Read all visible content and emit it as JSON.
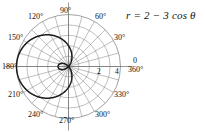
{
  "figure": {
    "equation_text": "r = 2 − 3 cos θ",
    "equation_parts": {
      "lhs": "r",
      "equals": "=",
      "a": "2",
      "minus": "−",
      "b": "3",
      "trig": "cos",
      "theta": "θ"
    }
  },
  "axis_labels": {
    "a90": "90°",
    "a120": "120°",
    "a60": "60°",
    "a150": "150°",
    "a30": "30°",
    "a180": "180°",
    "a0": "0",
    "a360": "360°",
    "a210": "210°",
    "a330": "330°",
    "a240": "240°",
    "a300": "300°",
    "a270": "270°"
  },
  "radial_labels": {
    "r2": "2",
    "r4": "4"
  },
  "colors": {
    "curve": "#1a1a1a",
    "grid": "#8a8a8a",
    "axis": "#6b6b6b",
    "text": "#111111",
    "background": "#ffffff"
  },
  "chart_data": {
    "type": "line",
    "coordinate_system": "polar",
    "title": "r = 2 − 3 cos θ",
    "curve_name": "limacon-with-inner-loop",
    "equation": "r = 2 - 3*cos(theta)",
    "parameters": {
      "a": 2,
      "b": 3
    },
    "theta_units": "degrees",
    "theta_range": [
      0,
      360
    ],
    "r_max_outer": 5,
    "r_min_signed": -1,
    "inner_loop_theta_range": [
      0,
      48.19
    ],
    "inner_loop_theta_range_2": [
      311.81,
      360
    ],
    "grid": true,
    "grid_radii": [
      1,
      2,
      3,
      4,
      5
    ],
    "labeled_radii": [
      2,
      4
    ],
    "grid_angles_deg": [
      0,
      15,
      30,
      45,
      60,
      75,
      90,
      105,
      120,
      135,
      150,
      165,
      180,
      195,
      210,
      225,
      240,
      255,
      270,
      285,
      300,
      315,
      330,
      345
    ],
    "labeled_angles_deg": [
      0,
      30,
      60,
      90,
      120,
      150,
      180,
      210,
      240,
      270,
      300,
      330,
      360
    ],
    "legend": "none",
    "xlabel": "",
    "ylabel": "",
    "samples": [
      {
        "theta": 0,
        "r": -1
      },
      {
        "theta": 10,
        "r": -0.954
      },
      {
        "theta": 20,
        "r": -0.819
      },
      {
        "theta": 30,
        "r": -0.598
      },
      {
        "theta": 40,
        "r": -0.298
      },
      {
        "theta": 48.19,
        "r": 0
      },
      {
        "theta": 60,
        "r": 0.5
      },
      {
        "theta": 75,
        "r": 1.224
      },
      {
        "theta": 90,
        "r": 2
      },
      {
        "theta": 105,
        "r": 2.776
      },
      {
        "theta": 120,
        "r": 3.5
      },
      {
        "theta": 135,
        "r": 4.121
      },
      {
        "theta": 150,
        "r": 4.598
      },
      {
        "theta": 165,
        "r": 4.898
      },
      {
        "theta": 180,
        "r": 5
      },
      {
        "theta": 195,
        "r": 4.898
      },
      {
        "theta": 210,
        "r": 4.598
      },
      {
        "theta": 225,
        "r": 4.121
      },
      {
        "theta": 240,
        "r": 3.5
      },
      {
        "theta": 255,
        "r": 2.776
      },
      {
        "theta": 270,
        "r": 2
      },
      {
        "theta": 285,
        "r": 1.224
      },
      {
        "theta": 300,
        "r": 0.5
      },
      {
        "theta": 311.81,
        "r": 0
      },
      {
        "theta": 320,
        "r": -0.298
      },
      {
        "theta": 330,
        "r": -0.598
      },
      {
        "theta": 340,
        "r": -0.819
      },
      {
        "theta": 350,
        "r": -0.954
      },
      {
        "theta": 360,
        "r": -1
      }
    ]
  }
}
